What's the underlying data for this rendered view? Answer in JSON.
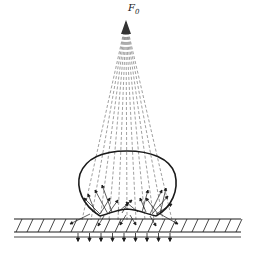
{
  "diagram": {
    "source_label": "F",
    "source_label_subscript": "0",
    "apex": {
      "x": 126,
      "y": 22
    },
    "ray_count": 11,
    "rays_end_left_x": 82,
    "rays_end_right_x": 172,
    "rays_end_y": 220,
    "ellipse": {
      "cx": 127,
      "cy": 185,
      "rx": 49,
      "ry": 34
    },
    "strip": {
      "x1": 14,
      "x2": 241,
      "top_y": 219,
      "bottom_y": 232,
      "base_y": 237
    },
    "colors": {
      "line": "#1a1a1a",
      "ray": "#777777"
    }
  }
}
